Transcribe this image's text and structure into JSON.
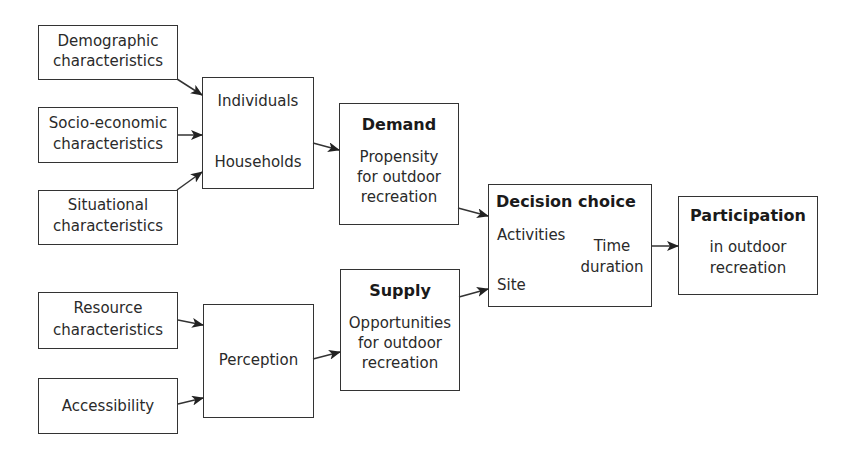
{
  "diagram": {
    "inputs_demand": {
      "demographic": {
        "line1": "Demographic",
        "line2": "characteristics"
      },
      "socio_economic": {
        "line1": "Socio-economic",
        "line2": "characteristics"
      },
      "situational": {
        "line1": "Situational",
        "line2": "characteristics"
      }
    },
    "units": {
      "individuals": "Individuals",
      "households": "Households"
    },
    "demand": {
      "title": "Demand",
      "line1": "Propensity",
      "line2": "for outdoor",
      "line3": "recreation"
    },
    "inputs_supply": {
      "resource": {
        "line1": "Resource",
        "line2": "characteristics"
      },
      "accessibility": {
        "line1": "Accessibility"
      }
    },
    "perception": {
      "label": "Perception"
    },
    "supply": {
      "title": "Supply",
      "line1": "Opportunities",
      "line2": "for outdoor",
      "line3": "recreation"
    },
    "decision": {
      "title": "Decision choice",
      "activities": "Activities",
      "time1": "Time",
      "time2": "duration",
      "site": "Site"
    },
    "participation": {
      "title": "Participation",
      "line1": "in outdoor",
      "line2": "recreation"
    },
    "colors": {
      "line": "#333333",
      "text": "#2a2a2a",
      "background": "#ffffff"
    }
  }
}
